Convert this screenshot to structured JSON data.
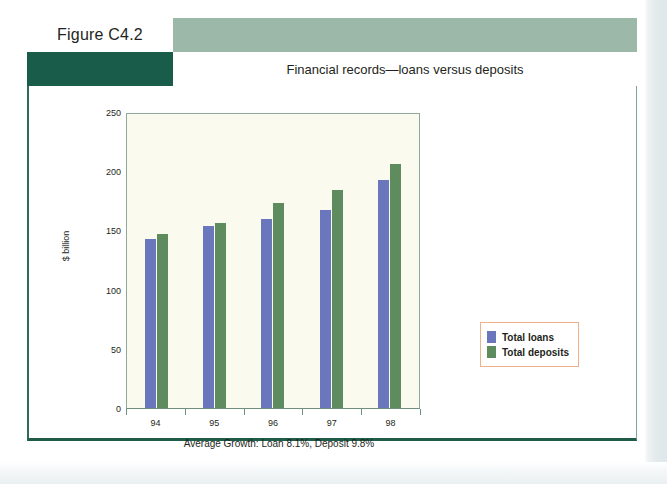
{
  "figure": {
    "label": "Figure C4.2",
    "title": "Financial records—loans versus deposits"
  },
  "colors": {
    "header_band": "#9bb8a8",
    "header_block": "#1a5c4a",
    "frame_border": "#2f6b57",
    "plot_background": "#fafaee",
    "plot_border": "#8fa89b",
    "loans": "#6b77bc",
    "deposits": "#5e8c5e",
    "legend_border": "#f0b089"
  },
  "chart_data": {
    "type": "bar",
    "title": "Financial records—loans versus deposits",
    "categories": [
      "94",
      "95",
      "96",
      "97",
      "98"
    ],
    "series": [
      {
        "name": "Total loans",
        "values": [
          143,
          154,
          160,
          167,
          193
        ],
        "color": "#6b77bc"
      },
      {
        "name": "Total deposits",
        "values": [
          147,
          156,
          173,
          184,
          206
        ],
        "color": "#5e8c5e"
      }
    ],
    "xlabel": "",
    "ylabel": "$ billion",
    "ylim": [
      0,
      250
    ],
    "yticks": [
      0,
      50,
      100,
      150,
      200,
      250
    ],
    "ytick_labels": [
      "0",
      "50",
      "100",
      "150",
      "200",
      "250"
    ],
    "grid": false,
    "legend_position": "right",
    "annotation": "Average Growth: Loan 8.1%, Deposit 9.8%"
  },
  "legend": {
    "items": [
      {
        "label": "Total loans"
      },
      {
        "label": "Total deposits"
      }
    ]
  }
}
